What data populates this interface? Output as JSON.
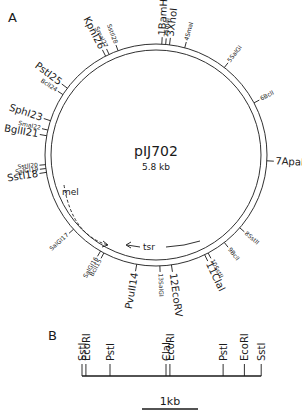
{
  "panel_a": {
    "label": "A",
    "plasmid_name": "pIJ702",
    "plasmid_size": "5.8 kb",
    "sites": [
      {
        "num": 1,
        "name": "BamHI",
        "big": true,
        "angle": 3
      },
      {
        "num": 2,
        "name": "SmaI",
        "big": false,
        "angle": 5
      },
      {
        "num": 3,
        "name": "XhoI",
        "big": true,
        "angle": 7
      },
      {
        "num": 4,
        "name": "SmaI",
        "big": false,
        "angle": 15
      },
      {
        "num": 5,
        "name": "SalGI",
        "big": false,
        "angle": 38
      },
      {
        "num": 6,
        "name": "BclI",
        "big": false,
        "angle": 62
      },
      {
        "num": 7,
        "name": "ApaI",
        "big": true,
        "angle": 93
      },
      {
        "num": 8,
        "name": "SstII",
        "big": false,
        "angle": 131
      },
      {
        "num": 9,
        "name": "BclI",
        "big": false,
        "angle": 142
      },
      {
        "num": 10,
        "name": "SstII",
        "big": false,
        "angle": 152
      },
      {
        "num": 11,
        "name": "ClaI",
        "big": true,
        "angle": 154
      },
      {
        "num": 12,
        "name": "EcoRV",
        "big": true,
        "angle": 172
      },
      {
        "num": 13,
        "name": "SalGI",
        "big": false,
        "angle": 178
      },
      {
        "num": 14,
        "name": "PvuII",
        "big": true,
        "angle": 190
      },
      {
        "num": 15,
        "name": "BclI",
        "big": false,
        "angle": 208
      },
      {
        "num": 16,
        "name": "SalGI",
        "big": false,
        "angle": 210
      },
      {
        "num": 17,
        "name": "SalGI",
        "big": false,
        "angle": 228
      },
      {
        "num": 18,
        "name": "SstI",
        "big": true,
        "angle": 261
      },
      {
        "num": 19,
        "name": "SalGI",
        "big": false,
        "angle": 263
      },
      {
        "num": 20,
        "name": "SstII",
        "big": false,
        "angle": 265
      },
      {
        "num": 21,
        "name": "BglII",
        "big": true,
        "angle": 280
      },
      {
        "num": 22,
        "name": "SmaI",
        "big": false,
        "angle": 283
      },
      {
        "num": 23,
        "name": "SphI",
        "big": true,
        "angle": 288
      },
      {
        "num": 24,
        "name": "BclI",
        "big": false,
        "angle": 303
      },
      {
        "num": 25,
        "name": "PstI",
        "big": true,
        "angle": 307
      },
      {
        "num": 26,
        "name": "KpnI",
        "big": true,
        "angle": 333
      },
      {
        "num": 27,
        "name": "SmaI",
        "big": false,
        "angle": 335
      },
      {
        "num": 28,
        "name": "SstII",
        "big": false,
        "angle": 340
      }
    ],
    "genes": [
      {
        "name": "mel",
        "style": "dashed"
      },
      {
        "name": "tsr",
        "style": "solid"
      }
    ]
  },
  "panel_b": {
    "label": "B",
    "sites": [
      {
        "name": "SstI",
        "pos_kb": 0.0
      },
      {
        "name": "EcoRI",
        "pos_kb": 0.07
      },
      {
        "name": "PstI",
        "pos_kb": 0.5
      },
      {
        "name": "ClaI",
        "pos_kb": 1.5
      },
      {
        "name": "EcoRI",
        "pos_kb": 1.57
      },
      {
        "name": "PstI",
        "pos_kb": 2.52
      },
      {
        "name": "EcoRI",
        "pos_kb": 2.9
      },
      {
        "name": "SstI",
        "pos_kb": 3.2
      }
    ],
    "scale_bar_label": "1kb",
    "scale_bar_kb": 1
  }
}
